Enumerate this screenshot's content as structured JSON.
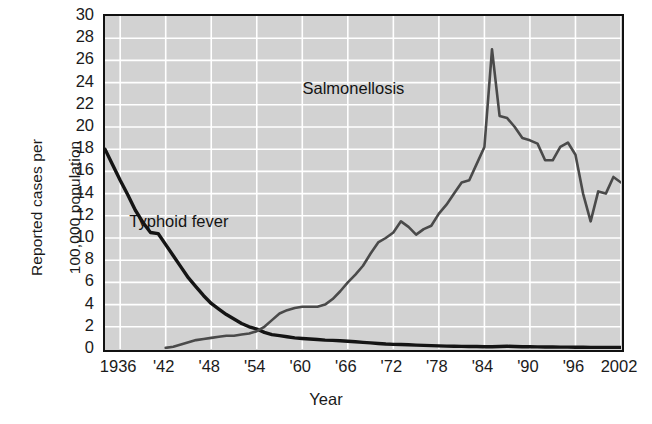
{
  "chart_data": {
    "type": "line",
    "title": "",
    "xlabel": "Year",
    "ylabel": "Reported cases per 100,000 population",
    "ylabel_lines": [
      "Reported cases per",
      "100,000 population"
    ],
    "xlim": [
      1934,
      2002
    ],
    "ylim": [
      0,
      30
    ],
    "ytick_step": 2,
    "yticks": [
      30,
      28,
      26,
      24,
      22,
      20,
      18,
      16,
      14,
      12,
      10,
      8,
      6,
      4,
      2,
      0
    ],
    "xticks": [
      1936,
      1942,
      1948,
      1954,
      1960,
      1966,
      1972,
      1978,
      1984,
      1990,
      1996,
      2002
    ],
    "xtick_labels": [
      "1936",
      "'42",
      "'48",
      "'54",
      "'60",
      "'66",
      "'72",
      "'78",
      "'84",
      "'90",
      "'96",
      "2002"
    ],
    "grid": true,
    "grid_color": "#ffffff",
    "plot_bgcolor": "#d2d2d2",
    "legend_position": "in-plot annotations",
    "annotations": [
      {
        "text": "Salmonellosis",
        "x": 1967,
        "y": 23.2
      },
      {
        "text": "Typhoid fever",
        "x": 1944,
        "y": 11.3
      }
    ],
    "series": [
      {
        "name": "Typhoid fever",
        "color": "#141414",
        "x": [
          1934,
          1935,
          1936,
          1937,
          1938,
          1939,
          1940,
          1941,
          1942,
          1943,
          1944,
          1945,
          1946,
          1947,
          1948,
          1949,
          1950,
          1951,
          1952,
          1953,
          1954,
          1955,
          1956,
          1957,
          1958,
          1959,
          1960,
          1961,
          1962,
          1963,
          1964,
          1965,
          1966,
          1967,
          1968,
          1969,
          1970,
          1971,
          1972,
          1973,
          1974,
          1975,
          1976,
          1977,
          1978,
          1979,
          1980,
          1981,
          1982,
          1983,
          1984,
          1985,
          1986,
          1987,
          1988,
          1989,
          1990,
          1991,
          1992,
          1993,
          1994,
          1995,
          1996,
          1997,
          1998,
          1999,
          2000,
          2001,
          2002
        ],
        "values": [
          18.0,
          16.6,
          15.2,
          13.9,
          12.5,
          11.4,
          10.5,
          10.4,
          9.4,
          8.4,
          7.4,
          6.4,
          5.6,
          4.8,
          4.1,
          3.6,
          3.1,
          2.7,
          2.3,
          2.0,
          1.8,
          1.5,
          1.3,
          1.2,
          1.1,
          1.0,
          0.95,
          0.9,
          0.85,
          0.8,
          0.78,
          0.75,
          0.7,
          0.65,
          0.6,
          0.55,
          0.5,
          0.45,
          0.42,
          0.4,
          0.38,
          0.35,
          0.33,
          0.3,
          0.28,
          0.26,
          0.25,
          0.24,
          0.23,
          0.22,
          0.2,
          0.2,
          0.22,
          0.25,
          0.22,
          0.2,
          0.2,
          0.19,
          0.18,
          0.18,
          0.17,
          0.17,
          0.16,
          0.16,
          0.15,
          0.15,
          0.14,
          0.14,
          0.13
        ]
      },
      {
        "name": "Salmonellosis",
        "color": "#4a4a4a",
        "x": [
          1942,
          1943,
          1944,
          1945,
          1946,
          1947,
          1948,
          1949,
          1950,
          1951,
          1952,
          1953,
          1954,
          1955,
          1956,
          1957,
          1958,
          1959,
          1960,
          1961,
          1962,
          1963,
          1964,
          1965,
          1966,
          1967,
          1968,
          1969,
          1970,
          1971,
          1972,
          1973,
          1974,
          1975,
          1976,
          1977,
          1978,
          1979,
          1980,
          1981,
          1982,
          1983,
          1984,
          1985,
          1986,
          1987,
          1988,
          1989,
          1990,
          1991,
          1992,
          1993,
          1994,
          1995,
          1996,
          1997,
          1998,
          1999,
          2000,
          2001,
          2002
        ],
        "values": [
          0.1,
          0.2,
          0.4,
          0.6,
          0.8,
          0.9,
          1.0,
          1.1,
          1.2,
          1.2,
          1.3,
          1.4,
          1.6,
          2.0,
          2.6,
          3.2,
          3.5,
          3.7,
          3.8,
          3.8,
          3.8,
          4.0,
          4.5,
          5.2,
          6.0,
          6.7,
          7.5,
          8.6,
          9.6,
          10.0,
          10.5,
          11.5,
          11.0,
          10.3,
          10.8,
          11.1,
          12.2,
          13.0,
          14.0,
          15.0,
          15.2,
          16.7,
          18.2,
          27.0,
          21.0,
          20.8,
          20.0,
          19.0,
          18.8,
          18.5,
          17.0,
          17.0,
          18.2,
          18.6,
          17.5,
          14.0,
          11.5,
          14.2,
          14.0,
          15.5,
          15.0
        ]
      }
    ]
  }
}
